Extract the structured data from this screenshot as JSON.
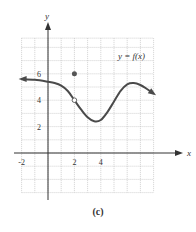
{
  "caption": "(c)",
  "chart_data": {
    "type": "line",
    "title": "",
    "function_label": "y = f(x)",
    "xlabel": "x",
    "ylabel": "y",
    "xlim": [
      -2,
      8
    ],
    "ylim": [
      -3,
      9
    ],
    "x_ticks": [
      {
        "value": -2,
        "label": "-2"
      },
      {
        "value": 2,
        "label": "2"
      },
      {
        "value": 4,
        "label": "4"
      }
    ],
    "y_ticks": [
      {
        "value": 2,
        "label": "2"
      },
      {
        "value": 4,
        "label": "4"
      },
      {
        "value": 6,
        "label": "6"
      }
    ],
    "grid": true,
    "curve_points": [
      [
        -2.0,
        5.6
      ],
      [
        -1.0,
        5.55
      ],
      [
        0.0,
        5.4
      ],
      [
        0.5,
        5.3
      ],
      [
        1.0,
        5.1
      ],
      [
        1.5,
        4.7
      ],
      [
        2.0,
        4.0
      ],
      [
        2.5,
        3.3
      ],
      [
        3.0,
        2.7
      ],
      [
        3.5,
        2.4
      ],
      [
        4.0,
        2.5
      ],
      [
        4.5,
        3.1
      ],
      [
        5.0,
        3.9
      ],
      [
        5.5,
        4.7
      ],
      [
        6.0,
        5.2
      ],
      [
        6.5,
        5.3
      ],
      [
        7.0,
        5.15
      ],
      [
        7.5,
        4.85
      ],
      [
        8.0,
        4.5
      ]
    ],
    "left_arrow": true,
    "right_arrow": true,
    "open_point": [
      2,
      4
    ],
    "closed_point": [
      2,
      6
    ],
    "colors": {
      "curve": "#4a4a4a",
      "grid": "#bdbdbd",
      "axis": "#333333",
      "point": "#555555"
    }
  }
}
